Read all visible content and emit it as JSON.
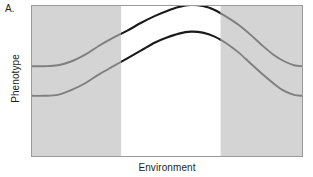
{
  "figure": {
    "panel_label": "A.",
    "xlabel": "Environment",
    "ylabel": "Phenotype"
  },
  "colors": {
    "band_shaded": "#d4d4d4",
    "band_unshaded": "#ffffff",
    "curve_outside": "#7f7f7f",
    "curve_inside": "#1a1a1a",
    "frame": "#9b9b9b",
    "text": "#231f20"
  },
  "chart_data": {
    "type": "line",
    "title": "",
    "xlabel": "Environment",
    "ylabel": "Phenotype",
    "xlim": [
      0,
      272
    ],
    "ylim": [
      0,
      152
    ],
    "grid": false,
    "legend": "none",
    "axis_ticks": {
      "x": [],
      "y": []
    },
    "shaded_bands": [
      {
        "name": "left-shaded-band",
        "x_start": 0,
        "x_end": 90,
        "color": "#d4d4d4"
      },
      {
        "name": "center-unshaded-band",
        "x_start": 90,
        "x_end": 190,
        "color": "#ffffff"
      },
      {
        "name": "right-shaded-band",
        "x_start": 190,
        "x_end": 272,
        "color": "#d4d4d4"
      }
    ],
    "series": [
      {
        "name": "upper-reaction-norm",
        "description": "upper genotype reaction norm: low plateau, rises to a peak in the central unshaded environment, falls back to a plateau",
        "points": [
          [
            0,
            91
          ],
          [
            12,
            91
          ],
          [
            26,
            90
          ],
          [
            40,
            85
          ],
          [
            54,
            78
          ],
          [
            68,
            69
          ],
          [
            82,
            61
          ],
          [
            96,
            53
          ],
          [
            110,
            45
          ],
          [
            124,
            37
          ],
          [
            136,
            32
          ],
          [
            148,
            28
          ],
          [
            160,
            26
          ],
          [
            172,
            27
          ],
          [
            184,
            31
          ],
          [
            196,
            38
          ],
          [
            208,
            47
          ],
          [
            220,
            58
          ],
          [
            232,
            69
          ],
          [
            244,
            79
          ],
          [
            254,
            86
          ],
          [
            264,
            90
          ],
          [
            272,
            91
          ]
        ],
        "segment_colors": [
          {
            "x_start": 0,
            "x_end": 90,
            "color": "#7f7f7f"
          },
          {
            "x_start": 90,
            "x_end": 190,
            "color": "#1a1a1a"
          },
          {
            "x_start": 190,
            "x_end": 272,
            "color": "#7f7f7f"
          }
        ]
      },
      {
        "name": "lower-reaction-norm",
        "description": "lower genotype reaction norm: parallel, offset downward by about 30 units",
        "points": [
          [
            0,
            61
          ],
          [
            12,
            61
          ],
          [
            26,
            60
          ],
          [
            40,
            56
          ],
          [
            54,
            49
          ],
          [
            68,
            40
          ],
          [
            82,
            32
          ],
          [
            96,
            25
          ],
          [
            110,
            17
          ],
          [
            124,
            10
          ],
          [
            136,
            5
          ],
          [
            148,
            1
          ],
          [
            160,
            -1
          ],
          [
            172,
            0
          ],
          [
            184,
            4
          ],
          [
            196,
            11
          ],
          [
            208,
            19
          ],
          [
            220,
            29
          ],
          [
            232,
            40
          ],
          [
            244,
            50
          ],
          [
            254,
            56
          ],
          [
            264,
            60
          ],
          [
            272,
            61
          ]
        ],
        "segment_colors": [
          {
            "x_start": 0,
            "x_end": 90,
            "color": "#7f7f7f"
          },
          {
            "x_start": 90,
            "x_end": 190,
            "color": "#1a1a1a"
          },
          {
            "x_start": 190,
            "x_end": 272,
            "color": "#7f7f7f"
          }
        ]
      }
    ]
  }
}
